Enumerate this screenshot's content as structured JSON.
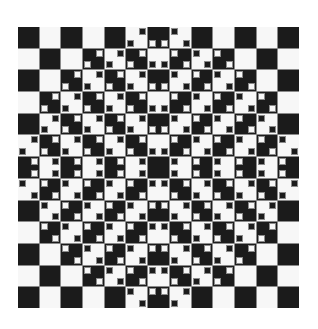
{
  "illusion": {
    "type": "checkerboard-bulge",
    "rows": 13,
    "cols": 13,
    "top_left_color": "dark",
    "colors": {
      "dark": "#1b1b1b",
      "light": "#f7f7f7",
      "grid_line": "#8a8a8a",
      "background": "#ffffff"
    },
    "marker_note": "Each cell lists the corners holding a small square of the opposite color; empty string = no markers.",
    "markers": [
      [
        "",
        "",
        "",
        "",
        "",
        "tr bl",
        "bl br",
        "tl br",
        "",
        "",
        "",
        "",
        ""
      ],
      [
        "",
        "",
        "",
        "tr bl",
        "tr bl",
        "tr bl",
        "bl br",
        "tl br",
        "tl br",
        "tl br",
        "",
        "",
        ""
      ],
      [
        "",
        "",
        "tr bl",
        "tr bl",
        "tr bl",
        "tr bl",
        "bl br",
        "tl br",
        "tl br",
        "tl br",
        "tl br",
        "",
        ""
      ],
      [
        "",
        "tr bl",
        "tr bl",
        "tr bl",
        "tr bl",
        "tr bl",
        "bl br",
        "tl br",
        "tl br",
        "tl br",
        "tl br",
        "tl br",
        ""
      ],
      [
        "",
        "tr bl",
        "tr bl",
        "tr bl",
        "tr bl",
        "tr bl",
        "bl br",
        "tl br",
        "tl br",
        "tl br",
        "tl br",
        "tl br",
        ""
      ],
      [
        "tr bl",
        "tr bl",
        "tr bl",
        "tr bl",
        "tr bl",
        "tr bl",
        "bl br",
        "tl br",
        "tl br",
        "tl br",
        "tl br",
        "tl br",
        "tl br"
      ],
      [
        "tr br",
        "tr br",
        "tr br",
        "tr br",
        "tr br",
        "tr br",
        "",
        "tl bl",
        "tl bl",
        "tl bl",
        "tl bl",
        "tl bl",
        "tl bl"
      ],
      [
        "tl br",
        "tl br",
        "tl br",
        "tl br",
        "tl br",
        "tl br",
        "tl tr",
        "tr bl",
        "tr bl",
        "tr bl",
        "tr bl",
        "tr bl",
        "tr bl"
      ],
      [
        "",
        "tl br",
        "tl br",
        "tl br",
        "tl br",
        "tl br",
        "tl tr",
        "tr bl",
        "tr bl",
        "tr bl",
        "tr bl",
        "tr bl",
        ""
      ],
      [
        "",
        "tl br",
        "tl br",
        "tl br",
        "tl br",
        "tl br",
        "tl tr",
        "tr bl",
        "tr bl",
        "tr bl",
        "tr bl",
        "tr bl",
        ""
      ],
      [
        "",
        "",
        "tl br",
        "tl br",
        "tl br",
        "tl br",
        "tl tr",
        "tr bl",
        "tr bl",
        "tr bl",
        "tr bl",
        "",
        ""
      ],
      [
        "",
        "",
        "",
        "tl br",
        "tl br",
        "tl br",
        "tl tr",
        "tr bl",
        "tr bl",
        "tr bl",
        "",
        "",
        ""
      ],
      [
        "",
        "",
        "",
        "",
        "",
        "tl br",
        "tl tr",
        "tr bl",
        "",
        "",
        "",
        "",
        ""
      ]
    ]
  }
}
